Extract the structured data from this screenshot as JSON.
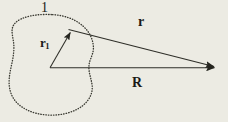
{
  "figure": {
    "background_color": "#ecebe3",
    "ink_color": "#2a2a26",
    "width": 228,
    "height": 122,
    "labels": {
      "region": "1",
      "source_vector": "r",
      "source_vector_subscript": "1",
      "separation_vector": "r",
      "field_vector": "R"
    },
    "geometry": {
      "origin": {
        "x": 50,
        "y": 68
      },
      "source_point": {
        "x": 68,
        "y": 29
      },
      "field_point": {
        "x": 221,
        "y": 68
      },
      "blob_stroke": "dotted",
      "blob_bounds": {
        "left": 9,
        "top": 14,
        "right": 95,
        "bottom": 115
      }
    },
    "vectors": [
      {
        "name": "r1",
        "label": "r₁",
        "from": "origin",
        "to": "source_point",
        "arrowhead": true
      },
      {
        "name": "r",
        "label": "r",
        "from": "source_point",
        "to": "field_point",
        "arrowhead": true
      },
      {
        "name": "R",
        "label": "R",
        "from": "origin",
        "to": "field_point",
        "arrowhead": true
      }
    ]
  }
}
